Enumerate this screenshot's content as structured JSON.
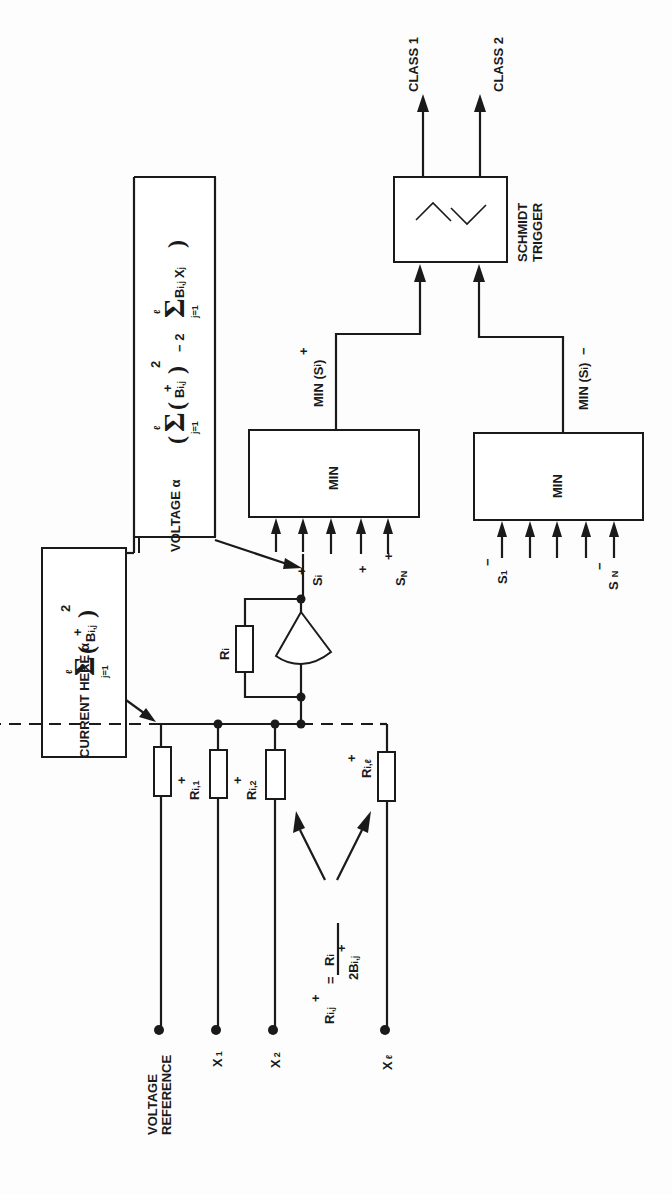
{
  "diagram": {
    "orientation": "rotated 90deg counter-clockwise",
    "outputs": {
      "class1": "CLASS 1",
      "class2": "CLASS 2"
    },
    "schmidt_trigger": {
      "label_line1": "SCHMIDT",
      "label_line2": "TRIGGER"
    },
    "min_blocks": {
      "top": {
        "label": "MIN",
        "output_label": "MIN (S",
        "output_sup": "+",
        "output_sub": "i",
        "inputs_first": "S",
        "inputs_first_sup": "+",
        "inputs_first_sub": "i",
        "inputs_last": "S",
        "inputs_last_sup": "+",
        "inputs_last_sub": "N",
        "input_count": 5
      },
      "bottom": {
        "label": "MIN",
        "output_label": "MIN (S",
        "output_sup": "−",
        "output_sub": "i",
        "inputs_first": "S",
        "inputs_first_sup": "−",
        "inputs_first_sub": "1",
        "inputs_last": "S",
        "inputs_last_sup": "−",
        "inputs_last_sub": "N",
        "input_count": 5
      }
    },
    "annotations": {
      "voltage": {
        "prefix": "VOLTAGE α",
        "sum1_upper": "ℓ",
        "sum1_lower": "j=1",
        "term1": "B",
        "term1_sup": "+",
        "term1_sub": "i,j",
        "term1_power": "2",
        "minus": "− 2",
        "sum2_upper": "ℓ",
        "sum2_lower": "j=1",
        "term2": "B",
        "term2_sub": "i,j",
        "term2_x": "X",
        "term2_x_sub": "j"
      },
      "current": {
        "prefix": "CURRENT HERE α",
        "sum_upper": "ℓ",
        "sum_lower": "j=1",
        "term": "B",
        "term_sup": "+",
        "term_sub": "i,j",
        "power": "2"
      }
    },
    "amplifier": {
      "feedback_resistor": "R",
      "feedback_resistor_sub": "i",
      "output_node": "S",
      "output_node_sup": "+",
      "output_node_sub": "i"
    },
    "resistors": [
      {
        "name": "R",
        "sup": "+",
        "sub": "i,1"
      },
      {
        "name": "R",
        "sup": "+",
        "sub": "i,2"
      },
      {
        "name": "R",
        "sup": "+",
        "sub": "i,ℓ"
      }
    ],
    "inputs": [
      {
        "label": "VOLTAGE",
        "label2": "REFERENCE"
      },
      {
        "label": "X",
        "sub": "1"
      },
      {
        "label": "X",
        "sub": "2"
      },
      {
        "label": "X",
        "sub": "ℓ"
      }
    ],
    "formula": {
      "lhs": "R",
      "lhs_sup": "+",
      "lhs_sub": "i,j",
      "eq": "=",
      "num": "R",
      "num_sub": "i",
      "den": "2B",
      "den_sup": "+",
      "den_sub": "i,j"
    }
  }
}
